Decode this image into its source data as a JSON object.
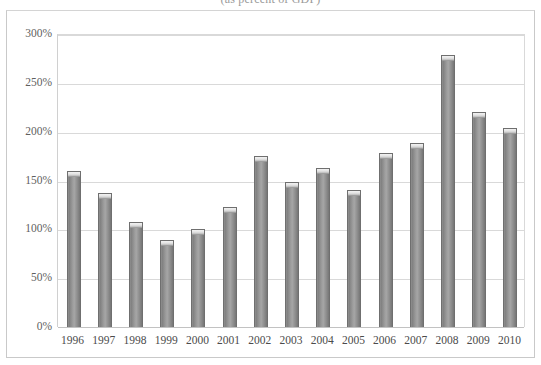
{
  "chart_data": {
    "type": "bar",
    "title": "(as percent of GDP)",
    "subtitle": "",
    "xlabel": "",
    "ylabel": "",
    "categories": [
      "1996",
      "1997",
      "1998",
      "1999",
      "2000",
      "2001",
      "2002",
      "2003",
      "2004",
      "2005",
      "2006",
      "2007",
      "2008",
      "2009",
      "2010"
    ],
    "values": [
      160,
      137,
      108,
      89,
      100,
      123,
      175,
      148,
      163,
      140,
      178,
      188,
      279,
      220,
      204
    ],
    "value_labels": [
      "160%",
      "137%",
      "108%",
      "89%",
      "100%",
      "123%",
      "175%",
      "148%",
      "163%",
      "140%",
      "178%",
      "188%",
      "279%",
      "220%",
      "204%"
    ],
    "ylim": [
      0,
      300
    ],
    "ytick_values": [
      0,
      50,
      100,
      150,
      200,
      250,
      300
    ],
    "ytick_labels": [
      "0%",
      "50%",
      "100%",
      "150%",
      "200%",
      "250%",
      "300%"
    ],
    "grid": true,
    "legend": false,
    "legend_position": "none",
    "series_name": "",
    "bar_color": "#8e8e8e",
    "bar_edge_color": "#6f6f6f",
    "bar_cap_color": "#e2e2e2",
    "gridline_color": "#d9d9d9",
    "axis_color": "#c2c2c2",
    "background_color": "#ffffff",
    "tick_label_color": "#4b4b4b"
  }
}
